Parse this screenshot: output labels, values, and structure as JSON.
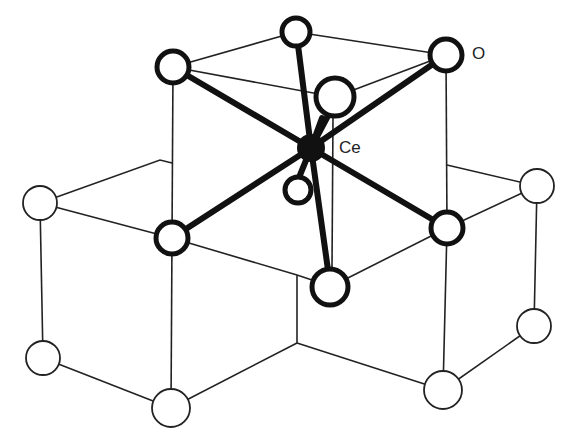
{
  "diagram": {
    "labels": {
      "oxygen": "O",
      "cerium": "Ce"
    },
    "colors": {
      "line": "#222222",
      "bond": "#111111",
      "ce_fill": "#111111",
      "atom_fill": "#ffffff",
      "background": "#ffffff"
    },
    "center_atom": {
      "element": "Ce",
      "x": 311,
      "y": 148,
      "r": 13
    },
    "coordinated_oxygens": [
      {
        "id": "o-top-center",
        "x": 296,
        "y": 32,
        "r": 15
      },
      {
        "id": "o-top-left",
        "x": 173,
        "y": 67,
        "r": 17
      },
      {
        "id": "o-top-right",
        "x": 446,
        "y": 55,
        "r": 16
      },
      {
        "id": "o-front-upper",
        "x": 335,
        "y": 97,
        "r": 19
      },
      {
        "id": "o-back-lower",
        "x": 298,
        "y": 190,
        "r": 14
      },
      {
        "id": "o-mid-left",
        "x": 172,
        "y": 238,
        "r": 17
      },
      {
        "id": "o-mid-right",
        "x": 447,
        "y": 228,
        "r": 16
      },
      {
        "id": "o-front-lower",
        "x": 330,
        "y": 287,
        "r": 19
      }
    ],
    "lattice_oxygens": [
      {
        "id": "o-far-left",
        "x": 40,
        "y": 203,
        "r": 17
      },
      {
        "id": "o-far-right",
        "x": 537,
        "y": 186,
        "r": 17
      },
      {
        "id": "o-bottom-left",
        "x": 43,
        "y": 358,
        "r": 17
      },
      {
        "id": "o-bottom-center",
        "x": 171,
        "y": 408,
        "r": 19
      },
      {
        "id": "o-bottom-right",
        "x": 443,
        "y": 390,
        "r": 19
      },
      {
        "id": "o-right-lower",
        "x": 534,
        "y": 326,
        "r": 17
      }
    ]
  }
}
